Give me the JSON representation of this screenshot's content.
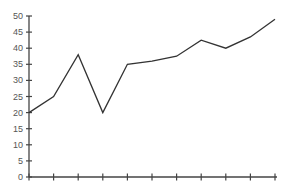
{
  "chart_data": {
    "type": "line",
    "title": "",
    "xlabel": "",
    "ylabel": "",
    "x": [
      0,
      1,
      2,
      3,
      4,
      5,
      6,
      7,
      8,
      9,
      10
    ],
    "categories": [
      "",
      "",
      "",
      "",
      "",
      "",
      "",
      "",
      "",
      "",
      ""
    ],
    "series": [
      {
        "name": "series-1",
        "values": [
          20,
          25,
          38,
          20,
          35,
          36,
          37.5,
          42.5,
          40,
          43.5,
          49
        ],
        "color": "#333333"
      }
    ],
    "ylim": [
      0,
      50
    ],
    "yticks": [
      0,
      5,
      10,
      15,
      20,
      25,
      30,
      35,
      40,
      45,
      50
    ],
    "xticks_count": 11,
    "grid": false,
    "legend": null
  },
  "colors": {
    "line": "#333333",
    "axis": "#444444",
    "label": "#555555",
    "background": "#ffffff"
  }
}
